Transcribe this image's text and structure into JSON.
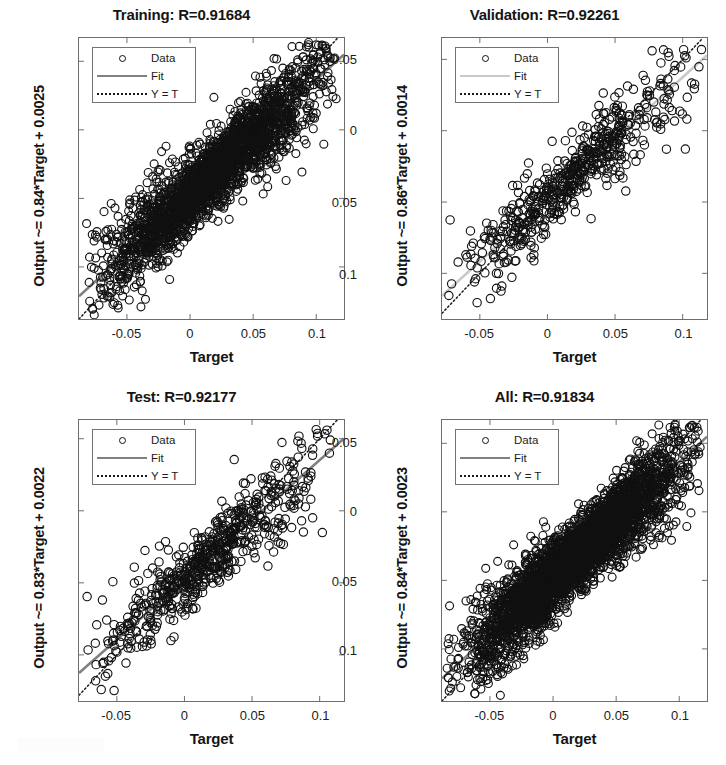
{
  "figure": {
    "width": 726,
    "height": 765,
    "background": "#ffffff",
    "layout": "2x2 grid of regression scatter plots"
  },
  "common": {
    "xlabel": "Target",
    "x_ticks": [
      "-0.05",
      "0",
      "0.05",
      "0.1"
    ],
    "y_ticks": [
      "0.1",
      "0.05",
      "0",
      "-0.05"
    ],
    "legend": {
      "data_label": "Data",
      "fit_label": "Fit",
      "identity_label": "Y = T",
      "marker_icon": "circle-marker-icon",
      "fit_icon": "solid-line-icon",
      "identity_icon": "dotted-line-icon"
    },
    "colors": {
      "marker": "#111111",
      "fit_line": "#808080",
      "fit_line_light": "#c9c9c9",
      "identity_line": "#1a1a1a",
      "axis": "#6d6d6d",
      "text": "#151515",
      "background": "#ffffff"
    }
  },
  "chart_data": [
    {
      "type": "scatter",
      "panel": "training",
      "title": "Training: R=0.91684",
      "xlabel": "Target",
      "ylabel": "Output ~= 0.84*Target + 0.0025",
      "r_value": 0.91684,
      "fit_slope": 0.84,
      "fit_intercept": 0.0025,
      "xlim": [
        -0.088,
        0.122
      ],
      "ylim": [
        -0.088,
        0.117
      ],
      "x_ticks": [
        -0.05,
        0,
        0.05,
        0.1
      ],
      "y_ticks": [
        -0.05,
        0,
        0.05,
        0.1
      ],
      "n_points": 2520,
      "point_spread": 0.0115,
      "x_center": 0.018,
      "x_sigma": 0.042,
      "grid": false,
      "legend_position": "upper-left",
      "fit_color": "#808080",
      "marker_radius": 4.0,
      "seed": 10501
    },
    {
      "type": "scatter",
      "panel": "validation",
      "title": "Validation: R=0.92261",
      "xlabel": "Target",
      "ylabel": "Output ~= 0.86*Target + 0.0014",
      "r_value": 0.92261,
      "fit_slope": 0.86,
      "fit_intercept": 0.0014,
      "xlim": [
        -0.078,
        0.118
      ],
      "ylim": [
        -0.082,
        0.115
      ],
      "x_ticks": [
        -0.05,
        0,
        0.05,
        0.1
      ],
      "y_ticks": [
        -0.05,
        0,
        0.05,
        0.1
      ],
      "n_points": 560,
      "point_spread": 0.0108,
      "x_center": 0.018,
      "x_sigma": 0.04,
      "grid": false,
      "legend_position": "upper-left",
      "fit_color": "#c9c9c9",
      "marker_radius": 4.2,
      "seed": 20789
    },
    {
      "type": "scatter",
      "panel": "test",
      "title": "Test: R=0.92177",
      "xlabel": "Target",
      "ylabel": "Output ~= 0.83*Target + 0.0022",
      "r_value": 0.92177,
      "fit_slope": 0.83,
      "fit_intercept": 0.0022,
      "xlim": [
        -0.078,
        0.118
      ],
      "ylim": [
        -0.082,
        0.113
      ],
      "x_ticks": [
        -0.05,
        0,
        0.05,
        0.1
      ],
      "y_ticks": [
        -0.05,
        0,
        0.05,
        0.1
      ],
      "n_points": 620,
      "point_spread": 0.011,
      "x_center": 0.018,
      "x_sigma": 0.041,
      "grid": false,
      "legend_position": "upper-left",
      "fit_color": "#808080",
      "marker_radius": 4.2,
      "seed": 31337
    },
    {
      "type": "scatter",
      "panel": "all",
      "title": "All: R=0.91834",
      "xlabel": "Target",
      "ylabel": "Output ~= 0.84*Target + 0.0023",
      "r_value": 0.91834,
      "fit_slope": 0.84,
      "fit_intercept": 0.0023,
      "xlim": [
        -0.088,
        0.122
      ],
      "ylim": [
        -0.088,
        0.117
      ],
      "x_ticks": [
        -0.05,
        0,
        0.05,
        0.1
      ],
      "y_ticks": [
        -0.05,
        0,
        0.05,
        0.1
      ],
      "n_points": 3600,
      "point_spread": 0.0115,
      "x_center": 0.018,
      "x_sigma": 0.042,
      "grid": false,
      "legend_position": "upper-left",
      "fit_color": "#808080",
      "marker_radius": 4.0,
      "seed": 44111
    }
  ]
}
